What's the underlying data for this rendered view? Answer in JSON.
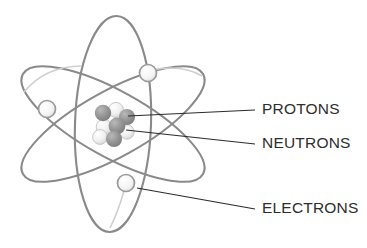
{
  "figure": {
    "background_color": "#ffffff",
    "width": 367,
    "height": 248
  },
  "palette": {
    "orbit_stroke": "#8a8a8a",
    "orbit_stroke_light": "#bdbdbd",
    "electron_fill": "#f2f2f2",
    "electron_stroke": "#9a9a9a",
    "proton_fill": "#909090",
    "neutron_fill": "#ededed",
    "neutron_stroke": "#c4c4c4",
    "leader_line": "#2b2b2b",
    "label_text": "#2e2e2e"
  },
  "nucleus": {
    "center": {
      "x": 113,
      "y": 124
    },
    "particles": [
      {
        "kind": "proton",
        "cx": 103,
        "cy": 113,
        "r": 8.2
      },
      {
        "kind": "neutron",
        "cx": 116,
        "cy": 110,
        "r": 7.6
      },
      {
        "kind": "proton",
        "cx": 127,
        "cy": 117,
        "r": 8.0
      },
      {
        "kind": "neutron",
        "cx": 104,
        "cy": 127,
        "r": 7.8
      },
      {
        "kind": "proton",
        "cx": 117,
        "cy": 126,
        "r": 8.4
      },
      {
        "kind": "neutron",
        "cx": 100,
        "cy": 137,
        "r": 7.4
      },
      {
        "kind": "proton",
        "cx": 114,
        "cy": 139,
        "r": 8.0
      },
      {
        "kind": "neutron",
        "cx": 127,
        "cy": 132,
        "r": 7.2
      }
    ]
  },
  "orbits": [
    {
      "name": "orbit-vertical",
      "cx": 113,
      "cy": 124,
      "rx": 38,
      "ry": 108,
      "rotation": 2
    },
    {
      "name": "orbit-tilted-up",
      "cx": 113,
      "cy": 124,
      "rx": 103,
      "ry": 33,
      "rotation": -29
    },
    {
      "name": "orbit-tilted-down",
      "cx": 113,
      "cy": 124,
      "rx": 103,
      "ry": 33,
      "rotation": 29
    }
  ],
  "electrons": [
    {
      "name": "electron-top-right",
      "cx": 148,
      "cy": 73,
      "r": 8.5
    },
    {
      "name": "electron-left",
      "cx": 47,
      "cy": 109,
      "r": 8.5
    },
    {
      "name": "electron-bottom",
      "cx": 126,
      "cy": 183,
      "r": 8.5
    }
  ],
  "labels": [
    {
      "id": "protons",
      "text": "PROTONS",
      "text_x": 262,
      "text_y": 110,
      "leader": {
        "x1": 128,
        "y1": 116,
        "x2": 255,
        "y2": 110
      }
    },
    {
      "id": "neutrons",
      "text": "NEUTRONS",
      "text_x": 262,
      "text_y": 144,
      "leader": {
        "x1": 126,
        "y1": 130,
        "x2": 255,
        "y2": 144
      }
    },
    {
      "id": "electrons",
      "text": "ELECTRONS",
      "text_x": 262,
      "text_y": 209,
      "leader": {
        "x1": 137,
        "y1": 188,
        "x2": 255,
        "y2": 209
      }
    }
  ]
}
